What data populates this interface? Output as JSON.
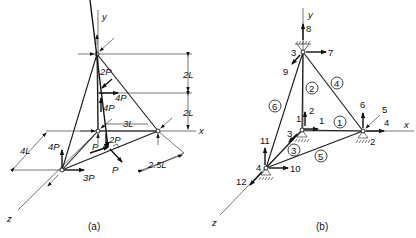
{
  "figure_a": {
    "caption": "(a)",
    "axes": {
      "x": "x",
      "y": "y",
      "z": "z"
    },
    "dimensions": {
      "top": "2L",
      "middle": "2L",
      "horizontal": "3L",
      "depth": "4L",
      "perpendicular": "2.5L"
    },
    "loads": {
      "apex_down": "2P",
      "mid_x": "4P",
      "mid_y": "4P",
      "origin_down": "2P",
      "z_node_y": "4P",
      "z_node_x": "3P",
      "member_axial": "P",
      "member_perp": "P"
    }
  },
  "figure_b": {
    "caption": "(b)",
    "axes": {
      "x": "x",
      "y": "y",
      "z": "z"
    },
    "nodes": [
      "1",
      "2",
      "3",
      "4"
    ],
    "members": [
      "1",
      "2",
      "3",
      "4",
      "5",
      "6"
    ],
    "dofs": [
      "1",
      "2",
      "3",
      "4",
      "5",
      "6",
      "7",
      "8",
      "9",
      "10",
      "11",
      "12"
    ]
  }
}
